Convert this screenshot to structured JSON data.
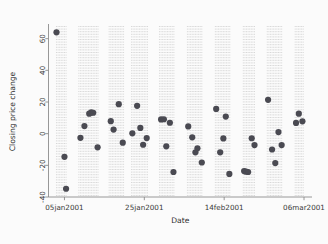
{
  "chart_data": {
    "type": "scatter",
    "title": "",
    "xlabel": "Date",
    "ylabel": "Closing price change",
    "grid": "vertical-dotted",
    "legend": "none",
    "marker": {
      "shape": "circle",
      "color": "#4a4a52",
      "size": 3.1
    },
    "ylim": [
      -40,
      68
    ],
    "yticks": [
      -40,
      -20,
      0,
      20,
      40,
      60
    ],
    "ytick_labels": [
      "-40",
      "-20",
      "0",
      "20",
      "40",
      "60"
    ],
    "xlim_dates": [
      "03jan2001",
      "09mar2001"
    ],
    "xticks": [
      "05jan2001",
      "25jan2001",
      "14feb2001",
      "06mar2001"
    ],
    "xtick_labels": [
      "05jan2001",
      "25jan2001",
      "14feb2001",
      "06mar2001"
    ],
    "x_unit": "days_since_05jan2001",
    "points": [
      {
        "x": -2.0,
        "y": 64.0
      },
      {
        "x": 0.0,
        "y": -14.6
      },
      {
        "x": 0.4,
        "y": -34.8
      },
      {
        "x": 4.0,
        "y": -2.6
      },
      {
        "x": 5.0,
        "y": 4.8
      },
      {
        "x": 6.2,
        "y": 12.6
      },
      {
        "x": 6.7,
        "y": 13.4
      },
      {
        "x": 7.2,
        "y": 13.2
      },
      {
        "x": 8.3,
        "y": -8.6
      },
      {
        "x": 11.6,
        "y": 7.9
      },
      {
        "x": 12.3,
        "y": 2.6
      },
      {
        "x": 13.6,
        "y": 18.6
      },
      {
        "x": 14.6,
        "y": -5.7
      },
      {
        "x": 17.0,
        "y": 0.2
      },
      {
        "x": 18.2,
        "y": 17.6
      },
      {
        "x": 19.0,
        "y": 3.6
      },
      {
        "x": 19.7,
        "y": -7.0
      },
      {
        "x": 20.6,
        "y": -2.8
      },
      {
        "x": 24.2,
        "y": 9.0
      },
      {
        "x": 24.9,
        "y": 9.1
      },
      {
        "x": 25.5,
        "y": -8.0
      },
      {
        "x": 26.4,
        "y": 6.9
      },
      {
        "x": 27.3,
        "y": -24.2
      },
      {
        "x": 31.0,
        "y": 4.6
      },
      {
        "x": 32.0,
        "y": -2.3
      },
      {
        "x": 32.8,
        "y": -11.8
      },
      {
        "x": 33.3,
        "y": -9.2
      },
      {
        "x": 34.4,
        "y": -18.2
      },
      {
        "x": 38.0,
        "y": 15.6
      },
      {
        "x": 39.0,
        "y": -11.8
      },
      {
        "x": 39.8,
        "y": -3.0
      },
      {
        "x": 40.4,
        "y": 10.8
      },
      {
        "x": 41.3,
        "y": -25.4
      },
      {
        "x": 45.0,
        "y": -23.6
      },
      {
        "x": 45.5,
        "y": -24.0
      },
      {
        "x": 46.0,
        "y": -24.2
      },
      {
        "x": 46.9,
        "y": -2.9
      },
      {
        "x": 47.6,
        "y": -7.2
      },
      {
        "x": 51.0,
        "y": 21.4
      },
      {
        "x": 52.0,
        "y": -10.0
      },
      {
        "x": 52.8,
        "y": -18.6
      },
      {
        "x": 53.6,
        "y": 1.0
      },
      {
        "x": 54.4,
        "y": -7.2
      },
      {
        "x": 58.0,
        "y": 6.8
      },
      {
        "x": 58.7,
        "y": 12.6
      },
      {
        "x": 59.6,
        "y": 7.8
      }
    ],
    "gridline_x_values": [
      -2.0,
      -1.6,
      -1.2,
      -0.8,
      -0.4,
      0.0,
      0.4,
      3.6,
      4.0,
      4.4,
      4.8,
      5.2,
      5.6,
      6.0,
      6.4,
      6.8,
      7.2,
      7.6,
      8.0,
      8.4,
      11.2,
      11.6,
      12.0,
      12.4,
      12.8,
      13.2,
      13.6,
      14.0,
      14.4,
      14.8,
      16.8,
      17.2,
      17.6,
      18.0,
      18.4,
      18.8,
      19.2,
      19.6,
      20.0,
      20.4,
      20.8,
      23.8,
      24.2,
      24.6,
      25.0,
      25.4,
      25.8,
      26.2,
      26.6,
      27.0,
      27.4,
      30.8,
      31.2,
      31.6,
      32.0,
      32.4,
      32.8,
      33.2,
      33.6,
      34.0,
      34.4,
      37.8,
      38.2,
      38.6,
      39.0,
      39.4,
      39.8,
      40.2,
      40.6,
      41.0,
      41.4,
      44.8,
      45.2,
      45.6,
      46.0,
      46.4,
      46.8,
      47.2,
      47.6,
      50.8,
      51.2,
      51.6,
      52.0,
      52.4,
      52.8,
      53.2,
      53.6,
      54.0,
      54.4,
      57.8,
      58.2,
      58.6,
      59.0,
      59.4,
      59.8
    ]
  }
}
